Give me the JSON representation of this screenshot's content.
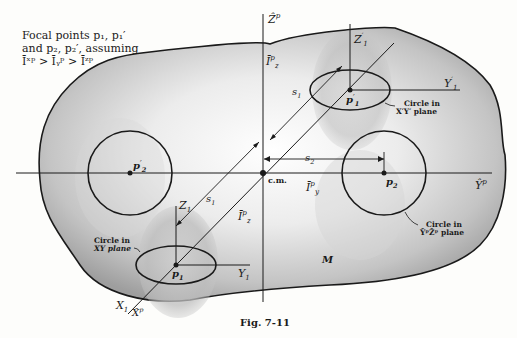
{
  "caption": {
    "line1": "Focal points p₁, p₁′",
    "line2": "and p₂, p₂′, assuming",
    "line3": "Īˣᵖ > Īᵧᵖ > Īᶻᵖ"
  },
  "figure_label": "Fig. 7-11",
  "axes": {
    "z_hat": "Ẑ",
    "z_hat_sup": "p",
    "y_hat": "Ŷ",
    "y_hat_sup": "p",
    "x_hat": "X̂",
    "x_hat_sup": "p"
  },
  "labels": {
    "cm": "c.m.",
    "mass": "M",
    "s1_upper": "s",
    "s1_lower": "s",
    "s2": "s",
    "sub1": "1",
    "sub2": "2",
    "Iz_upper": "Ī",
    "Iz_lower": "Ī",
    "Iy": "Ī",
    "sup_p": "p",
    "sub_z": "z",
    "sub_y": "y",
    "Z1": "Z",
    "Y1": "Y",
    "X1": "X",
    "Z1p": "Z",
    "Y1p": "Y",
    "prime": "′"
  },
  "points": {
    "p1": "p",
    "p1_prime": "p",
    "p2": "p",
    "p2_prime": "p"
  },
  "annotations": {
    "circle_xy_l1": "Circle in",
    "circle_xy_l2": "XY plane",
    "circle_xpyp_l1": "Circle in",
    "circle_xpyp_l2": "X′Y′ plane",
    "circle_ypzp_l1": "Circle in",
    "circle_ypzp_l2": "ŶᵖẐᵖ plane"
  },
  "colors": {
    "ink": "#1a1a1a",
    "paper": "#fdfdfb",
    "body_shade": "#b8b8b8"
  }
}
